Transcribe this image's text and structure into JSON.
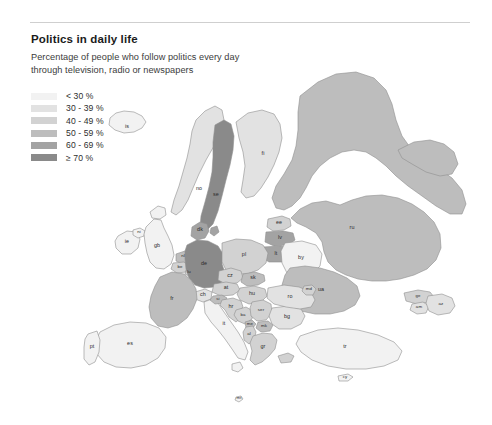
{
  "header": {
    "title": "Politics in daily life",
    "subtitle": "Percentage of people who follow politics every day through television, radio or newspapers"
  },
  "legend": {
    "items": [
      {
        "label": "< 30 %",
        "color": "#f2f2f2"
      },
      {
        "label": "30 - 39 %",
        "color": "#e2e2e2"
      },
      {
        "label": "40 - 49 %",
        "color": "#d2d2d2"
      },
      {
        "label": "50 - 59 %",
        "color": "#bdbdbd"
      },
      {
        "label": "60 - 69 %",
        "color": "#a3a3a3"
      },
      {
        "label": "≥ 70 %",
        "color": "#8a8a8a"
      }
    ]
  },
  "chart_data": {
    "type": "map",
    "title": "Politics in daily life",
    "subtitle": "Percentage of people who follow politics every day through television, radio or newspapers",
    "unit": "percent",
    "classes": [
      "< 30 %",
      "30 - 39 %",
      "40 - 49 %",
      "50 - 59 %",
      "60 - 69 %",
      "≥ 70 %"
    ],
    "class_colors": [
      "#f2f2f2",
      "#e2e2e2",
      "#d2d2d2",
      "#bdbdbd",
      "#a3a3a3",
      "#8a8a8a"
    ],
    "no_data_color": "#bdbdbd",
    "regions": [
      {
        "code": "is",
        "label": "is",
        "class": 0
      },
      {
        "code": "no",
        "label": "no",
        "class": 1
      },
      {
        "code": "se",
        "label": "se",
        "class": 5
      },
      {
        "code": "fi",
        "label": "fi",
        "class": 1
      },
      {
        "code": "dk",
        "label": "dk",
        "class": 4
      },
      {
        "code": "ee",
        "label": "ee",
        "class": 2
      },
      {
        "code": "lv",
        "label": "lv",
        "class": 4
      },
      {
        "code": "lt",
        "label": "lt",
        "class": 4
      },
      {
        "code": "by",
        "label": "by",
        "class": 0
      },
      {
        "code": "ru",
        "label": "ru",
        "class": 3
      },
      {
        "code": "ua",
        "label": "ua",
        "class": 3
      },
      {
        "code": "ie",
        "label": "ie",
        "class": 0
      },
      {
        "code": "ni",
        "label": "ni",
        "class": 0
      },
      {
        "code": "gb",
        "label": "gb",
        "class": 0
      },
      {
        "code": "nl",
        "label": "nl",
        "class": 3
      },
      {
        "code": "be",
        "label": "be",
        "class": 2
      },
      {
        "code": "lu",
        "label": "lu",
        "class": 2
      },
      {
        "code": "de",
        "label": "de",
        "class": 5
      },
      {
        "code": "pl",
        "label": "pl",
        "class": 2
      },
      {
        "code": "cz",
        "label": "cz",
        "class": 2
      },
      {
        "code": "sk",
        "label": "sk",
        "class": 3
      },
      {
        "code": "at",
        "label": "at",
        "class": 2
      },
      {
        "code": "ch",
        "label": "ch",
        "class": 1
      },
      {
        "code": "fr",
        "label": "fr",
        "class": 3
      },
      {
        "code": "es",
        "label": "es",
        "class": 0
      },
      {
        "code": "pt",
        "label": "pt",
        "class": 0
      },
      {
        "code": "it",
        "label": "it",
        "class": 0
      },
      {
        "code": "si",
        "label": "si",
        "class": 3
      },
      {
        "code": "hr",
        "label": "hr",
        "class": 2
      },
      {
        "code": "hu",
        "label": "hu",
        "class": 2
      },
      {
        "code": "ba",
        "label": "ba",
        "class": 2
      },
      {
        "code": "ser",
        "label": "ser",
        "class": 2
      },
      {
        "code": "me",
        "label": "me",
        "class": 3
      },
      {
        "code": "mk",
        "label": "mk",
        "class": 3
      },
      {
        "code": "al",
        "label": "al",
        "class": 2
      },
      {
        "code": "gr",
        "label": "gr",
        "class": 2
      },
      {
        "code": "bg",
        "label": "bg",
        "class": 1
      },
      {
        "code": "ro",
        "label": "ro",
        "class": 1
      },
      {
        "code": "md",
        "label": "md",
        "class": 2
      },
      {
        "code": "tr",
        "label": "tr",
        "class": 0
      },
      {
        "code": "cy",
        "label": "cy",
        "class": 0
      },
      {
        "code": "mt",
        "label": "mt",
        "class": 0
      },
      {
        "code": "ge",
        "label": "ge",
        "class": 2
      },
      {
        "code": "am",
        "label": "am",
        "class": 1
      },
      {
        "code": "az",
        "label": "az",
        "class": 1
      }
    ]
  }
}
